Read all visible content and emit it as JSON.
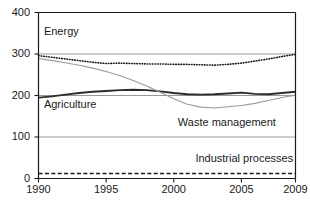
{
  "chart_data": {
    "type": "line",
    "title": "",
    "xlabel": "",
    "ylabel": "",
    "xlim": [
      1990,
      2009
    ],
    "ylim": [
      0,
      400
    ],
    "grid": true,
    "gridlines_y": [
      100,
      200,
      300
    ],
    "legend_position": "inline-annotations",
    "ytick_labels": [
      "0",
      "100",
      "200",
      "300",
      "400"
    ],
    "ytick_values": [
      0,
      100,
      200,
      300,
      400
    ],
    "xtick_labels": [
      "1990",
      "1995",
      "2000",
      "2005",
      "2009"
    ],
    "xtick_values": [
      1990,
      1995,
      2000,
      2005,
      2009
    ],
    "x": [
      1990,
      1991,
      1992,
      1993,
      1994,
      1995,
      1996,
      1997,
      1998,
      1999,
      2000,
      2001,
      2002,
      2003,
      2004,
      2005,
      2006,
      2007,
      2008,
      2009
    ],
    "series": [
      {
        "name": "Energy",
        "style": "dotted",
        "color": "#1a1a1a",
        "values": [
          296,
          292,
          288,
          284,
          280,
          277,
          278,
          277,
          276,
          276,
          275,
          275,
          274,
          273,
          275,
          278,
          283,
          288,
          294,
          299
        ]
      },
      {
        "name": "Agriculture",
        "style": "solid-thick",
        "color": "#2b2b2b",
        "values": [
          195,
          198,
          202,
          206,
          209,
          211,
          213,
          214,
          213,
          210,
          206,
          203,
          202,
          203,
          205,
          207,
          204,
          203,
          206,
          209
        ]
      },
      {
        "name": "Waste management",
        "style": "solid-thin",
        "color": "#9a9a9a",
        "values": [
          289,
          284,
          279,
          273,
          266,
          258,
          248,
          236,
          223,
          208,
          192,
          179,
          172,
          170,
          173,
          176,
          181,
          188,
          195,
          201
        ]
      },
      {
        "name": "Industrial processes",
        "style": "dashed",
        "color": "#1a1a1a",
        "values": [
          12,
          12,
          12,
          12,
          12,
          12,
          12,
          12,
          12,
          12,
          12,
          12,
          12,
          12,
          12,
          12,
          12,
          12,
          12,
          12
        ]
      }
    ],
    "annotations": [
      {
        "text": "Energy",
        "x": 1990.4,
        "y": 352
      },
      {
        "text": "Agriculture",
        "x": 1990.4,
        "y": 178
      },
      {
        "text": "Waste management",
        "x": 2000.3,
        "y": 133
      },
      {
        "text": "Industrial processes",
        "x": 2001.6,
        "y": 48
      }
    ]
  },
  "colors": {
    "axis": "#1a1a1a",
    "grid": "#8c8c8c",
    "background": "#ffffff",
    "energy": "#1a1a1a",
    "agriculture": "#2b2b2b",
    "waste": "#9a9a9a",
    "industrial": "#1a1a1a"
  }
}
